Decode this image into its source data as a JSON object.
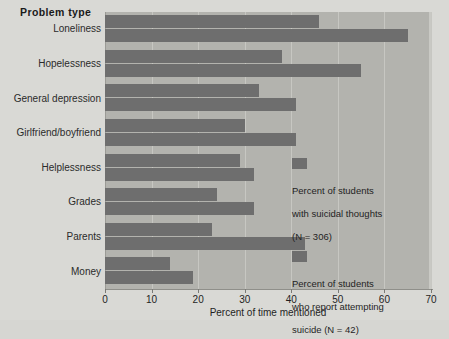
{
  "title": "Problem type",
  "chart_data": {
    "type": "bar",
    "orientation": "horizontal",
    "title": "Problem type",
    "xlabel": "Percent of time mentioned",
    "ylabel": "Problem type",
    "xlim": [
      0,
      70
    ],
    "xticks": [
      0,
      10,
      20,
      30,
      40,
      50,
      60,
      70
    ],
    "grid": true,
    "legend_position": "inside-right",
    "categories": [
      "Loneliness",
      "Hopelessness",
      "General depression",
      "Girlfriend/boyfriend",
      "Helplessness",
      "Grades",
      "Parents",
      "Money"
    ],
    "series": [
      {
        "name": "Percent of students with suicidal thoughts (N = 306)",
        "color": "#6e6e6e",
        "values": [
          46,
          38,
          33,
          30,
          29,
          24,
          23,
          14
        ]
      },
      {
        "name": "Percent of students who report attempting suicide (N = 42)",
        "color": "#6e6e6e",
        "values": [
          65,
          55,
          41,
          41,
          32,
          32,
          43,
          19
        ]
      }
    ]
  },
  "xaxis": {
    "label": "Percent of time mentioned",
    "ticks": [
      "0",
      "10",
      "20",
      "30",
      "40",
      "50",
      "60",
      "70"
    ]
  },
  "legend": {
    "entries": [
      {
        "line1": "Percent of students",
        "line2": "with suicidal thoughts",
        "line3": "(N = 306)"
      },
      {
        "line1": "Percent of students",
        "line2": "who report attempting",
        "line3": "suicide (N = 42)"
      }
    ]
  },
  "colors": {
    "bar": "#6e6e6e",
    "plot_background": "#b3b3ae",
    "page_background": "#d9d9d5",
    "gridline": "#c7c7c2"
  }
}
